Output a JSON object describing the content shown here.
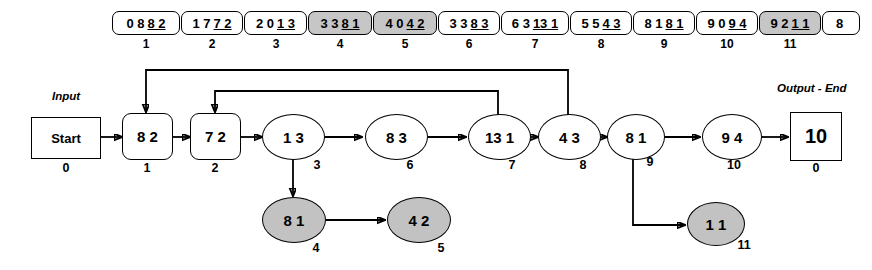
{
  "diagram": {
    "input_label": "Input",
    "output_label": "Output - End",
    "colors": {
      "shaded_fill": "#c6c6c6",
      "node_gray_fill": "#c2c2c2",
      "stroke": "#000000",
      "background": "#ffffff"
    }
  },
  "tape": {
    "cells": [
      {
        "index": "1",
        "prefix": "0 8",
        "underlined": "8 2",
        "shaded": false
      },
      {
        "index": "2",
        "prefix": "1 7",
        "underlined": "7 2",
        "shaded": false
      },
      {
        "index": "3",
        "prefix": "2 0",
        "underlined": "1 3",
        "shaded": false
      },
      {
        "index": "4",
        "prefix": "3 3",
        "underlined": "8 1",
        "shaded": true
      },
      {
        "index": "5",
        "prefix": "4 0",
        "underlined": "4 2",
        "shaded": true
      },
      {
        "index": "6",
        "prefix": "3 3",
        "underlined": "8 3",
        "shaded": false
      },
      {
        "index": "7",
        "prefix": "6 3",
        "underlined": "13 1",
        "shaded": false
      },
      {
        "index": "8",
        "prefix": "5 5",
        "underlined": "4 3",
        "shaded": false
      },
      {
        "index": "9",
        "prefix": "8 1",
        "underlined": "8 1",
        "shaded": false
      },
      {
        "index": "10",
        "prefix": "9 0",
        "underlined": "9 4",
        "shaded": false
      },
      {
        "index": "11",
        "prefix": "9 2",
        "underlined": "1 1",
        "shaded": true
      },
      {
        "index": "",
        "prefix": "8",
        "underlined": "",
        "shaded": false
      }
    ]
  },
  "nodes": [
    {
      "id": "start",
      "label": "Start",
      "index": "0",
      "shape": "rect",
      "gray": false
    },
    {
      "id": "n1",
      "label": "8 2",
      "index": "1",
      "shape": "round",
      "gray": false
    },
    {
      "id": "n2",
      "label": "7 2",
      "index": "2",
      "shape": "round",
      "gray": false
    },
    {
      "id": "n3",
      "label": "1 3",
      "index": "3",
      "shape": "ell",
      "gray": false
    },
    {
      "id": "n6",
      "label": "8 3",
      "index": "6",
      "shape": "ell",
      "gray": false
    },
    {
      "id": "n7",
      "label": "13 1",
      "index": "7",
      "shape": "ell",
      "gray": false
    },
    {
      "id": "n8",
      "label": "4 3",
      "index": "8",
      "shape": "ell",
      "gray": false
    },
    {
      "id": "n9",
      "label": "8 1",
      "index": "9",
      "shape": "ell",
      "gray": false
    },
    {
      "id": "n10",
      "label": "9 4",
      "index": "10",
      "shape": "ell",
      "gray": false
    },
    {
      "id": "end",
      "label": "10",
      "index": "0",
      "shape": "rect",
      "gray": false
    },
    {
      "id": "n4",
      "label": "8 1",
      "index": "4",
      "shape": "ell",
      "gray": true
    },
    {
      "id": "n5",
      "label": "4 2",
      "index": "5",
      "shape": "ell",
      "gray": true
    },
    {
      "id": "n11",
      "label": "1 1",
      "index": "11",
      "shape": "ell",
      "gray": true
    }
  ],
  "edges": [
    {
      "from": "start",
      "to": "n1",
      "kind": "straight"
    },
    {
      "from": "n1",
      "to": "n2",
      "kind": "straight"
    },
    {
      "from": "n2",
      "to": "n3",
      "kind": "straight"
    },
    {
      "from": "n3",
      "to": "n6",
      "kind": "straight"
    },
    {
      "from": "n6",
      "to": "n7",
      "kind": "straight"
    },
    {
      "from": "n7",
      "to": "n8",
      "kind": "straight"
    },
    {
      "from": "n8",
      "to": "n9",
      "kind": "straight"
    },
    {
      "from": "n9",
      "to": "n10",
      "kind": "straight"
    },
    {
      "from": "n10",
      "to": "end",
      "kind": "straight"
    },
    {
      "from": "n3",
      "to": "n4",
      "kind": "down"
    },
    {
      "from": "n4",
      "to": "n5",
      "kind": "straight"
    },
    {
      "from": "n9",
      "to": "n11",
      "kind": "down-right"
    },
    {
      "from": "n8",
      "to": "n1",
      "kind": "feedback-top"
    },
    {
      "from": "n7",
      "to": "n2",
      "kind": "feedback-inner"
    }
  ]
}
